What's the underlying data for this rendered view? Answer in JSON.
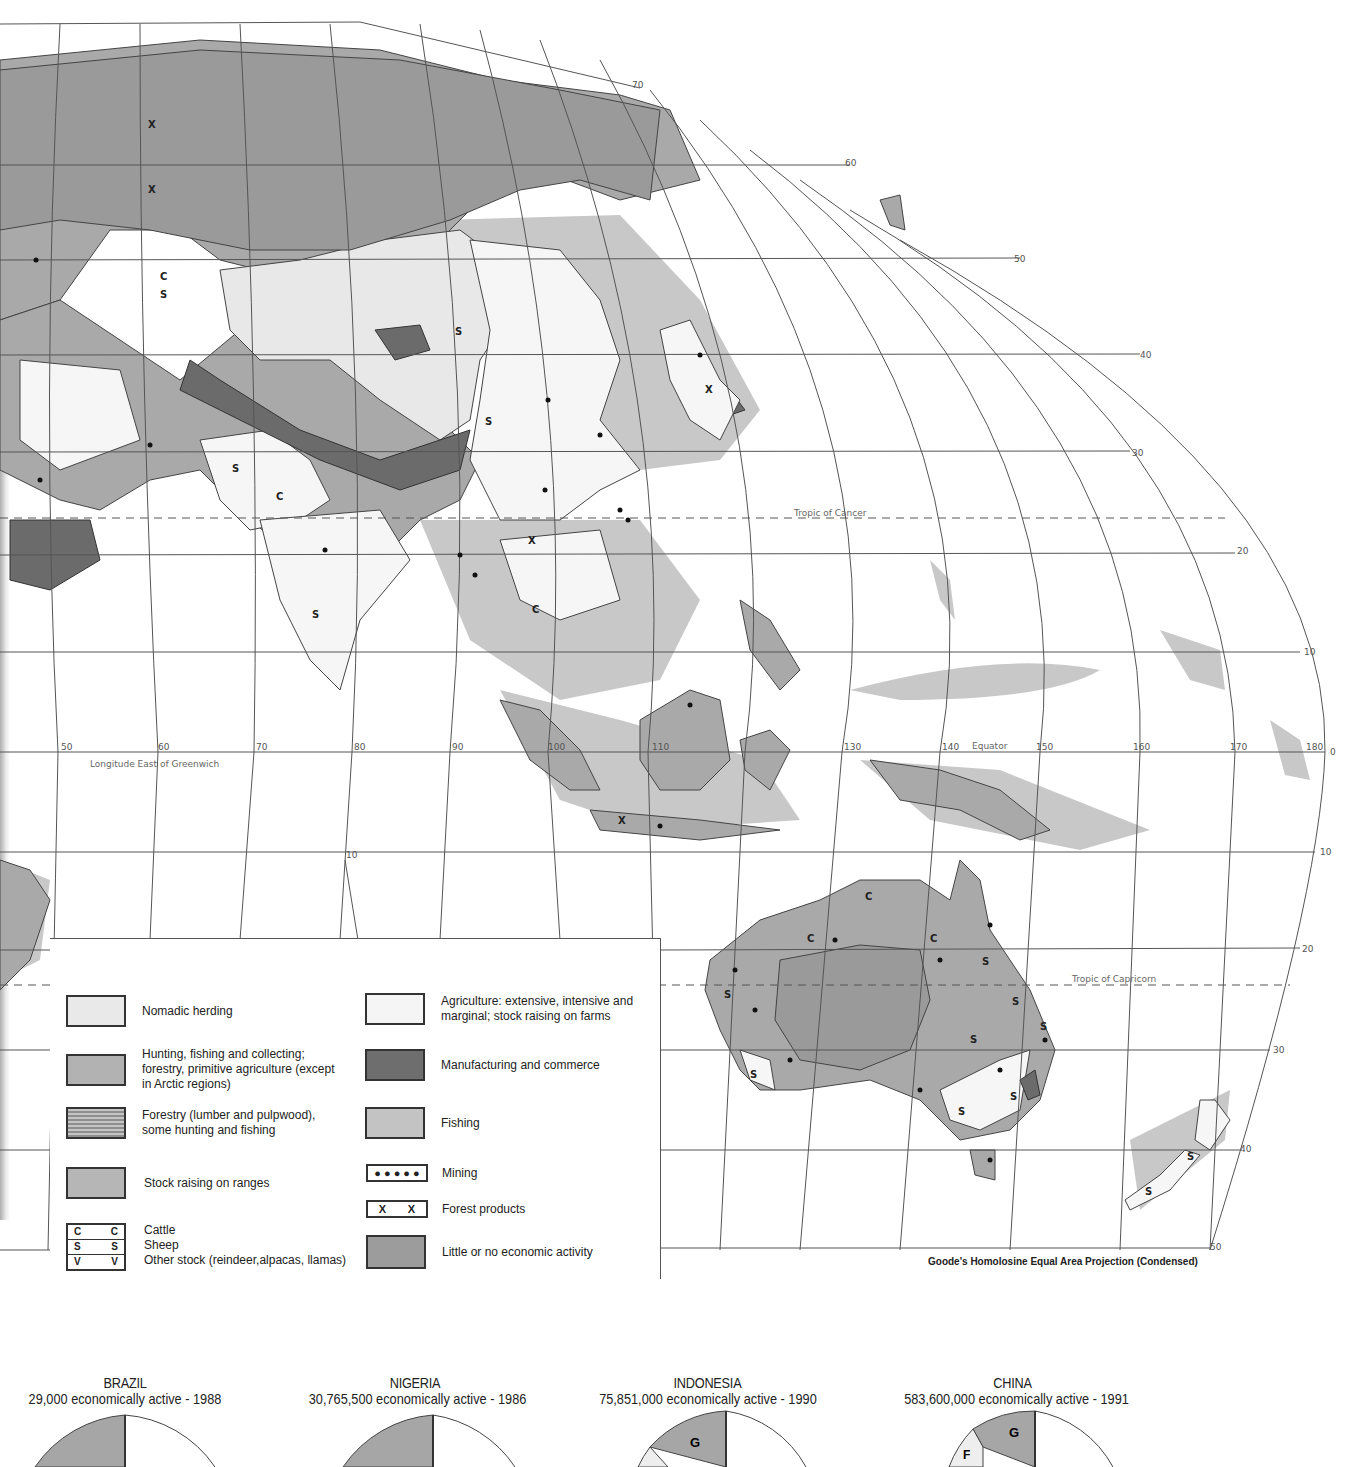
{
  "map": {
    "latitude_labels": {
      "top": [
        "70",
        "60",
        "50",
        "40",
        "30",
        "20",
        "10"
      ],
      "right_south": [
        "10",
        "20",
        "30",
        "40",
        "50"
      ],
      "equator_right": "0"
    },
    "longitude_labels": [
      "50",
      "60",
      "70",
      "80",
      "90",
      "100",
      "110",
      "130",
      "140",
      "150",
      "160",
      "170",
      "180"
    ],
    "lat_10_south_label": "10",
    "longitude_caption": "Longitude East of Greenwich",
    "tropic_cancer": "Tropic of Cancer",
    "tropic_capricorn": "Tropic of Capricorn",
    "equator": "Equator",
    "projection": "Goode's Homolosine Equal Area Projection (Condensed)",
    "symbols": {
      "cattle": "C",
      "sheep": "S",
      "other": "V",
      "forest": "X"
    }
  },
  "legend": {
    "left": [
      {
        "name": "nomadic-herding",
        "label": "Nomadic herding"
      },
      {
        "name": "hunting-fishing",
        "label": "Hunting, fishing and collecting; forestry, primitive agriculture (except in Arctic regions)"
      },
      {
        "name": "forestry",
        "label": "Forestry (lumber and pulpwood), some hunting and fishing"
      },
      {
        "name": "stock-raising",
        "label": "Stock raising on  ranges"
      }
    ],
    "stock_symbols": [
      {
        "symbol": "C",
        "label": "Cattle"
      },
      {
        "symbol": "S",
        "label": "Sheep"
      },
      {
        "symbol": "V",
        "label": "Other stock (reindeer,alpacas, llamas)"
      }
    ],
    "right": [
      {
        "name": "agriculture",
        "label": "Agriculture: extensive, intensive and marginal; stock raising on farms"
      },
      {
        "name": "manufacturing",
        "label": "Manufacturing and commerce"
      },
      {
        "name": "fishing",
        "label": "Fishing"
      },
      {
        "name": "mining",
        "label": "Mining"
      },
      {
        "name": "forest-products",
        "label": "Forest products",
        "symbol": "X"
      },
      {
        "name": "little-activity",
        "label": "Little or no economic activity"
      }
    ]
  },
  "pies": [
    {
      "country": "BRAZIL",
      "subtitle": "29,000 economically active - 1988",
      "labels": []
    },
    {
      "country": "NIGERIA",
      "subtitle": "30,765,500 economically active - 1986",
      "labels": []
    },
    {
      "country": "INDONESIA",
      "subtitle": "75,851,000 economically active - 1990",
      "labels": [
        "G"
      ]
    },
    {
      "country": "CHINA",
      "subtitle": "583,600,000 economically active - 1991",
      "labels": [
        "G",
        "F"
      ]
    }
  ]
}
